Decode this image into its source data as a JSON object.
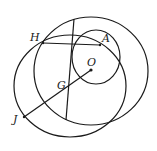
{
  "diagram": {
    "type": "geometry",
    "stroke_color": "#1a1a1a",
    "background": "#ffffff",
    "points": [
      {
        "name": "H",
        "x": 43,
        "y": 43,
        "label_x": 30,
        "label_y": 41
      },
      {
        "name": "A",
        "x": 100,
        "y": 45,
        "label_x": 102,
        "label_y": 42
      },
      {
        "name": "O",
        "x": 91,
        "y": 70,
        "label_x": 87,
        "label_y": 66
      },
      {
        "name": "G",
        "x": 69,
        "y": 82,
        "label_x": 57,
        "label_y": 89
      },
      {
        "name": "J",
        "x": 24,
        "y": 117,
        "label_x": 13,
        "label_y": 123
      }
    ],
    "labels": {
      "H": "H",
      "A": "A",
      "O": "O",
      "G": "G",
      "J": "J"
    },
    "circles": [
      {
        "name": "small-circle",
        "cx": 96,
        "cy": 57,
        "rx": 24,
        "ry": 27
      },
      {
        "name": "large-circle-o",
        "cx": 91,
        "cy": 71,
        "rx": 57,
        "ry": 54
      },
      {
        "name": "left-circle",
        "cx": 70,
        "cy": 86,
        "rx": 56,
        "ry": 51
      }
    ],
    "segments": [
      {
        "name": "segment-HA",
        "from": "H",
        "to": "A"
      },
      {
        "name": "segment-JO",
        "from": "J",
        "to": "O"
      },
      {
        "name": "vertical-chord",
        "x1": 74,
        "y1": 19,
        "x2": 66,
        "y2": 120
      }
    ]
  }
}
